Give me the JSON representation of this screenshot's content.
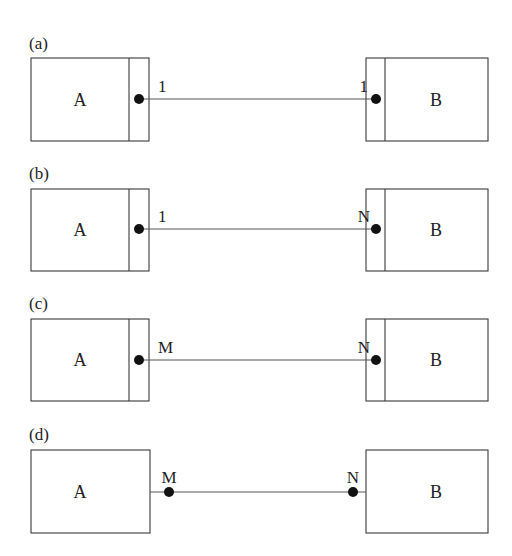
{
  "diagram": {
    "type": "entity-relationship cardinality notation",
    "colors": {
      "stroke": "#3a3a3a",
      "dot": "#111111",
      "text": "#222222",
      "background": "#ffffff"
    },
    "panels": [
      {
        "id": "a",
        "label": "(a)",
        "left_entity": "A",
        "right_entity": "B",
        "left_cardinality": "1",
        "right_cardinality": "1",
        "left_partition": true,
        "right_partition": true
      },
      {
        "id": "b",
        "label": "(b)",
        "left_entity": "A",
        "right_entity": "B",
        "left_cardinality": "1",
        "right_cardinality": "N",
        "left_partition": true,
        "right_partition": true
      },
      {
        "id": "c",
        "label": "(c)",
        "left_entity": "A",
        "right_entity": "B",
        "left_cardinality": "M",
        "right_cardinality": "N",
        "left_partition": true,
        "right_partition": true
      },
      {
        "id": "d",
        "label": "(d)",
        "left_entity": "A",
        "right_entity": "B",
        "left_cardinality": "M",
        "right_cardinality": "N",
        "left_partition": false,
        "right_partition": false
      }
    ]
  }
}
